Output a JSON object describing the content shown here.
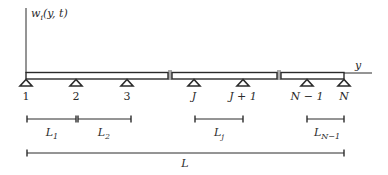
{
  "diagram": {
    "type": "multi-span continuous beam",
    "axis": {
      "vertical_label_main": "w",
      "vertical_label_sub": "i",
      "vertical_label_args": "(y, t)",
      "horizontal_label": "y"
    },
    "supports": [
      {
        "label": "1",
        "x": 26
      },
      {
        "label": "2",
        "x": 76
      },
      {
        "label": "3",
        "x": 127
      },
      {
        "label": "J",
        "x": 194
      },
      {
        "label": "J + 1",
        "x": 243
      },
      {
        "label": "N − 1",
        "x": 307
      },
      {
        "label": "N",
        "x": 344
      }
    ],
    "span_dimensions": [
      {
        "main": "L",
        "sub": "1"
      },
      {
        "main": "L",
        "sub": "2"
      },
      {
        "main": "L",
        "sub": "j"
      },
      {
        "main": "L",
        "sub": "N−1"
      }
    ],
    "total_dimension": {
      "main": "L"
    },
    "colors": {
      "line": "#2b2b2b",
      "beam_fill": "#ffffff",
      "background": "#ffffff"
    }
  }
}
